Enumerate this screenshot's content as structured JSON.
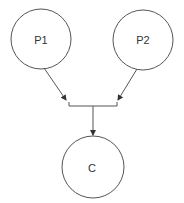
{
  "diagram": {
    "type": "directed-graph",
    "nodes": [
      {
        "id": "P1",
        "label": "P1",
        "cx": 41,
        "cy": 39,
        "r": 30
      },
      {
        "id": "P2",
        "label": "P2",
        "cx": 143,
        "cy": 40,
        "r": 30
      },
      {
        "id": "C",
        "label": "C",
        "cx": 93,
        "cy": 167,
        "r": 31
      }
    ],
    "edges": [
      {
        "from": "P1",
        "to": "junction"
      },
      {
        "from": "P2",
        "to": "junction"
      },
      {
        "from": "junction",
        "to": "C"
      }
    ],
    "colors": {
      "stroke": "#555555",
      "text": "#333333",
      "background": "#ffffff"
    }
  }
}
